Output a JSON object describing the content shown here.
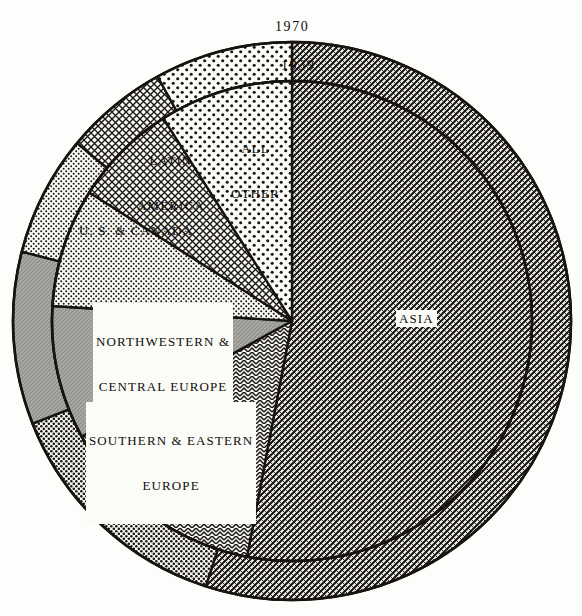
{
  "figure": {
    "title": "",
    "center_x": 292,
    "center_y": 321,
    "outer_radius": 279,
    "ring_inner_radius": 240,
    "ink_color": "#17140f",
    "paper_color": "#fdfdfb"
  },
  "year_labels": {
    "outer": "1970",
    "inner": "1939"
  },
  "labels": {
    "asia": "ASIA",
    "all_other_line1": "ALL",
    "all_other_line2": "OTHER",
    "latin_line1": "LATIN",
    "latin_line2": "AMERICA",
    "us_canada": "U. S. & CANADA",
    "nwce_line1": "NORTHWESTERN &",
    "nwce_line2": "CENTRAL EUROPE",
    "see_line1": "SOUTHERN & EASTERN",
    "see_line2": "EUROPE"
  },
  "chart_data": {
    "type": "pie",
    "title": "",
    "subtitle": "",
    "xlabel": "",
    "ylabel": "",
    "legend_position": "inside-slices",
    "grid": false,
    "note": "Nested pie: inner disc = 1939 shares, outer ring = 1970 shares. Values are percent of total and are read off the sector angles.",
    "categories": [
      "ASIA",
      "ALL OTHER",
      "LATIN AMERICA",
      "U. S. & CANADA",
      "NORTHWESTERN & CENTRAL EUROPE",
      "SOUTHERN & EASTERN EUROPE"
    ],
    "series": [
      {
        "name": "1939",
        "ring": "inner",
        "values": [
          53.0,
          9.0,
          7.0,
          8.0,
          9.0,
          14.0
        ]
      },
      {
        "name": "1970",
        "ring": "outer",
        "values": [
          55.0,
          8.0,
          6.0,
          7.0,
          10.0,
          14.0
        ]
      }
    ],
    "slices_1939": [
      {
        "label": "ASIA",
        "value": 53.0,
        "start_deg": 0,
        "end_deg": 190.8,
        "pattern": "dense-diagonal-weave"
      },
      {
        "label": "SOUTHERN & EASTERN EUROPE",
        "value": 14.0,
        "start_deg": 190.8,
        "end_deg": 241.2,
        "pattern": "herringbone"
      },
      {
        "label": "NORTHWESTERN & CENTRAL EUROPE",
        "value": 9.0,
        "start_deg": 241.2,
        "end_deg": 273.6,
        "pattern": "solid-gray"
      },
      {
        "label": "U. S. & CANADA",
        "value": 8.0,
        "start_deg": 273.6,
        "end_deg": 302.4,
        "pattern": "fine-dots"
      },
      {
        "label": "LATIN AMERICA",
        "value": 7.0,
        "start_deg": 302.4,
        "end_deg": 327.6,
        "pattern": "cross-hatch"
      },
      {
        "label": "ALL OTHER",
        "value": 9.0,
        "start_deg": 327.6,
        "end_deg": 360.0,
        "pattern": "coarse-dots"
      }
    ],
    "slices_1970": [
      {
        "label": "ASIA",
        "value": 55.0,
        "start_deg": 0,
        "end_deg": 198.0,
        "pattern": "dense-diagonal-weave"
      },
      {
        "label": "SOUTHERN & EASTERN EUROPE",
        "value": 14.0,
        "start_deg": 198.0,
        "end_deg": 248.4,
        "pattern": "medium-dots"
      },
      {
        "label": "NORTHWESTERN & CENTRAL EUROPE",
        "value": 10.0,
        "start_deg": 248.4,
        "end_deg": 284.4,
        "pattern": "solid-gray"
      },
      {
        "label": "U. S. & CANADA",
        "value": 7.0,
        "start_deg": 284.4,
        "end_deg": 309.6,
        "pattern": "fine-dots"
      },
      {
        "label": "LATIN AMERICA",
        "value": 6.0,
        "start_deg": 309.6,
        "end_deg": 331.2,
        "pattern": "cross-hatch"
      },
      {
        "label": "ALL OTHER",
        "value": 8.0,
        "start_deg": 331.2,
        "end_deg": 360.0,
        "pattern": "coarse-dots"
      }
    ]
  }
}
